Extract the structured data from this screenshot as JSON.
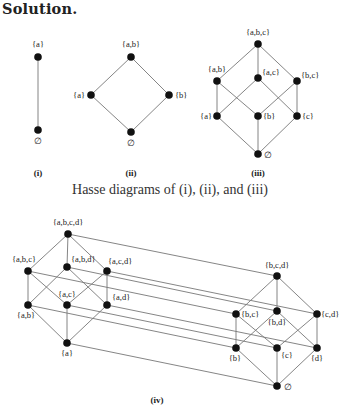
{
  "heading": "Solution.",
  "caption": "Hasse diagrams of (i), (ii), and (iii)",
  "colors": {
    "node": "#111111",
    "edge": "#777777",
    "text": "#222222"
  },
  "diagrams": [
    {
      "id": "i",
      "label": "(i)",
      "label_pos": [
        38,
        176
      ],
      "nodes": [
        {
          "id": "a",
          "text": "{a}",
          "x": 38,
          "y": 57,
          "lx": 38,
          "ly": 47,
          "anchor": "middle"
        },
        {
          "id": "e",
          "text": "∅",
          "x": 38,
          "y": 130,
          "lx": 38,
          "ly": 144,
          "anchor": "middle"
        }
      ],
      "edges": [
        [
          "a",
          "e"
        ]
      ]
    },
    {
      "id": "ii",
      "label": "(ii)",
      "label_pos": [
        131,
        176
      ],
      "nodes": [
        {
          "id": "ab",
          "text": "{a,b}",
          "x": 131,
          "y": 57,
          "lx": 131,
          "ly": 47,
          "anchor": "middle"
        },
        {
          "id": "a",
          "text": "{a}",
          "x": 91,
          "y": 95,
          "lx": 85,
          "ly": 98,
          "anchor": "end"
        },
        {
          "id": "b",
          "text": "{b}",
          "x": 169,
          "y": 95,
          "lx": 175,
          "ly": 98,
          "anchor": "start"
        },
        {
          "id": "e",
          "text": "∅",
          "x": 131,
          "y": 132,
          "lx": 131,
          "ly": 146,
          "anchor": "middle"
        }
      ],
      "edges": [
        [
          "ab",
          "a"
        ],
        [
          "ab",
          "b"
        ],
        [
          "a",
          "e"
        ],
        [
          "b",
          "e"
        ]
      ]
    },
    {
      "id": "iii",
      "label": "(iii)",
      "label_pos": [
        258,
        176
      ],
      "nodes": [
        {
          "id": "abc",
          "text": "{a,b,c}",
          "x": 258,
          "y": 44,
          "lx": 258,
          "ly": 35,
          "anchor": "middle"
        },
        {
          "id": "ab",
          "text": "{a,b}",
          "x": 217,
          "y": 81,
          "lx": 217,
          "ly": 72,
          "anchor": "middle"
        },
        {
          "id": "ac",
          "text": "{a,c}",
          "x": 258,
          "y": 78,
          "lx": 262,
          "ly": 75,
          "anchor": "start"
        },
        {
          "id": "bc",
          "text": "{b,c}",
          "x": 297,
          "y": 81,
          "lx": 301,
          "ly": 78,
          "anchor": "start"
        },
        {
          "id": "a",
          "text": "{a}",
          "x": 217,
          "y": 116,
          "lx": 212,
          "ly": 119,
          "anchor": "end"
        },
        {
          "id": "b",
          "text": "{b}",
          "x": 258,
          "y": 116,
          "lx": 263,
          "ly": 119,
          "anchor": "start"
        },
        {
          "id": "c",
          "text": "{c}",
          "x": 297,
          "y": 116,
          "lx": 302,
          "ly": 119,
          "anchor": "start"
        },
        {
          "id": "e",
          "text": "∅",
          "x": 258,
          "y": 154,
          "lx": 264,
          "ly": 158,
          "anchor": "start"
        }
      ],
      "edges": [
        [
          "abc",
          "ab"
        ],
        [
          "abc",
          "ac"
        ],
        [
          "abc",
          "bc"
        ],
        [
          "ab",
          "a"
        ],
        [
          "ab",
          "b"
        ],
        [
          "ac",
          "a"
        ],
        [
          "ac",
          "c"
        ],
        [
          "bc",
          "b"
        ],
        [
          "bc",
          "c"
        ],
        [
          "a",
          "e"
        ],
        [
          "b",
          "e"
        ],
        [
          "c",
          "e"
        ]
      ]
    },
    {
      "id": "iv",
      "label": "(iv)",
      "label_pos": [
        157,
        403
      ],
      "nodes": [
        {
          "id": "abcd",
          "text": "{a,b,c,d}",
          "x": 68,
          "y": 234,
          "lx": 68,
          "ly": 225,
          "anchor": "middle"
        },
        {
          "id": "abc",
          "text": "{a,b,c}",
          "x": 28,
          "y": 271,
          "lx": 24,
          "ly": 262,
          "anchor": "middle"
        },
        {
          "id": "abd",
          "text": "{a,b,d}",
          "x": 67,
          "y": 267,
          "lx": 71,
          "ly": 262,
          "anchor": "start"
        },
        {
          "id": "acd",
          "text": "{a,c,d}",
          "x": 107,
          "y": 271,
          "lx": 108,
          "ly": 264,
          "anchor": "start"
        },
        {
          "id": "ab",
          "text": "{a,b}",
          "x": 28,
          "y": 305,
          "lx": 26,
          "ly": 318,
          "anchor": "middle"
        },
        {
          "id": "ac",
          "text": "{a,c}",
          "x": 67,
          "y": 305,
          "lx": 67,
          "ly": 297,
          "anchor": "middle"
        },
        {
          "id": "ad",
          "text": "{a,d}",
          "x": 107,
          "y": 305,
          "lx": 112,
          "ly": 300,
          "anchor": "start"
        },
        {
          "id": "a",
          "text": "{a}",
          "x": 67,
          "y": 343,
          "lx": 67,
          "ly": 356,
          "anchor": "middle"
        },
        {
          "id": "bcd",
          "text": "{b,c,d}",
          "x": 277,
          "y": 276,
          "lx": 277,
          "ly": 268,
          "anchor": "middle"
        },
        {
          "id": "bc",
          "text": "{b,c}",
          "x": 236,
          "y": 314,
          "lx": 241,
          "ly": 317,
          "anchor": "start"
        },
        {
          "id": "bd",
          "text": "{b,d}",
          "x": 277,
          "y": 311,
          "lx": 277,
          "ly": 325,
          "anchor": "middle"
        },
        {
          "id": "cd",
          "text": "{c,d}",
          "x": 317,
          "y": 314,
          "lx": 321,
          "ly": 317,
          "anchor": "start"
        },
        {
          "id": "b",
          "text": "{b}",
          "x": 236,
          "y": 348,
          "lx": 235,
          "ly": 361,
          "anchor": "middle"
        },
        {
          "id": "c",
          "text": "{c}",
          "x": 277,
          "y": 348,
          "lx": 281,
          "ly": 358,
          "anchor": "start"
        },
        {
          "id": "d",
          "text": "{d}",
          "x": 317,
          "y": 348,
          "lx": 317,
          "ly": 361,
          "anchor": "middle"
        },
        {
          "id": "e",
          "text": "∅",
          "x": 277,
          "y": 386,
          "lx": 284,
          "ly": 390,
          "anchor": "start"
        }
      ],
      "edges": [
        [
          "abcd",
          "abc"
        ],
        [
          "abcd",
          "abd"
        ],
        [
          "abcd",
          "acd"
        ],
        [
          "abc",
          "ab"
        ],
        [
          "abc",
          "ac"
        ],
        [
          "abd",
          "ab"
        ],
        [
          "abd",
          "ad"
        ],
        [
          "acd",
          "ac"
        ],
        [
          "acd",
          "ad"
        ],
        [
          "ab",
          "a"
        ],
        [
          "ac",
          "a"
        ],
        [
          "ad",
          "a"
        ],
        [
          "bcd",
          "bc"
        ],
        [
          "bcd",
          "bd"
        ],
        [
          "bcd",
          "cd"
        ],
        [
          "bc",
          "b"
        ],
        [
          "bc",
          "c"
        ],
        [
          "bd",
          "b"
        ],
        [
          "bd",
          "d"
        ],
        [
          "cd",
          "c"
        ],
        [
          "cd",
          "d"
        ],
        [
          "b",
          "e"
        ],
        [
          "c",
          "e"
        ],
        [
          "d",
          "e"
        ],
        [
          "abcd",
          "bcd"
        ],
        [
          "abc",
          "bc"
        ],
        [
          "abd",
          "bd"
        ],
        [
          "acd",
          "cd"
        ],
        [
          "ab",
          "b"
        ],
        [
          "ac",
          "c"
        ],
        [
          "ad",
          "d"
        ],
        [
          "a",
          "e"
        ]
      ]
    }
  ]
}
